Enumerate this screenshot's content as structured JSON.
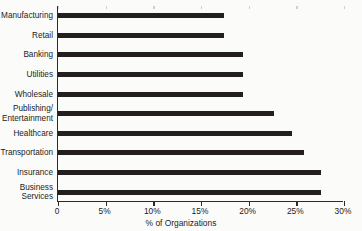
{
  "chart_data": {
    "type": "bar",
    "orientation": "horizontal",
    "title": "",
    "xlabel": "% of Organizations",
    "ylabel": "",
    "xlim": [
      0,
      30
    ],
    "xticks": [
      0,
      5,
      10,
      15,
      20,
      25,
      30
    ],
    "xtick_labels": [
      "0",
      "5%",
      "10%",
      "15%",
      "20%",
      "25%",
      "30%"
    ],
    "grid": false,
    "legend": null,
    "bar_color": "#231f1e",
    "categories": [
      "Manufacturing",
      "Retail",
      "Banking",
      "Utilities",
      "Wholesale",
      "Publishing/\nEntertainment",
      "Healthcare",
      "Transportation",
      "Insurance",
      "Business\nServices"
    ],
    "values": [
      17.4,
      17.4,
      19.4,
      19.4,
      19.4,
      22.7,
      24.5,
      25.8,
      27.6,
      27.6
    ]
  }
}
